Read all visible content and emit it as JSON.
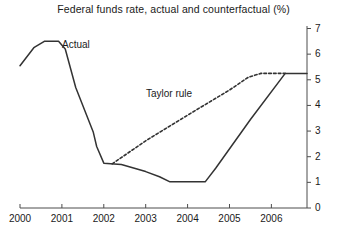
{
  "chart_data": {
    "type": "line",
    "title": "Federal funds rate, actual and counterfactual (%)",
    "xlabel": "",
    "ylabel": "",
    "ylim": [
      0,
      7
    ],
    "xlim": [
      2000,
      2006.85
    ],
    "grid": false,
    "yticks": [
      "0",
      "1",
      "2",
      "3",
      "4",
      "5",
      "6",
      "7"
    ],
    "ytick_values": [
      0,
      1,
      2,
      3,
      4,
      5,
      6,
      7
    ],
    "xticks": [
      "2000",
      "2001",
      "2002",
      "2003",
      "2004",
      "2005",
      "2006"
    ],
    "xtick_values": [
      2000,
      2001,
      2002,
      2003,
      2004,
      2005,
      2006
    ],
    "y_axis_position": "right",
    "legend": "inline-annotations",
    "annotations": [
      {
        "text": "Actual",
        "x": 2001.0,
        "y": 6.15
      },
      {
        "text": "Taylor rule",
        "x": 2003.05,
        "y": 4.45
      }
    ],
    "series": [
      {
        "name": "Actual",
        "style": "solid",
        "color": "#333333",
        "points": [
          [
            2000.0,
            5.55
          ],
          [
            2000.33,
            6.25
          ],
          [
            2000.58,
            6.5
          ],
          [
            2000.92,
            6.5
          ],
          [
            2001.08,
            6.2
          ],
          [
            2001.33,
            4.7
          ],
          [
            2001.75,
            2.95
          ],
          [
            2001.83,
            2.4
          ],
          [
            2002.0,
            1.75
          ],
          [
            2002.25,
            1.72
          ],
          [
            2002.42,
            1.7
          ],
          [
            2003.0,
            1.42
          ],
          [
            2003.33,
            1.22
          ],
          [
            2003.58,
            1.02
          ],
          [
            2004.42,
            1.02
          ],
          [
            2004.67,
            1.55
          ],
          [
            2005.5,
            3.45
          ],
          [
            2006.33,
            5.25
          ],
          [
            2006.85,
            5.25
          ]
        ]
      },
      {
        "name": "Taylor rule",
        "style": "dotted",
        "color": "#333333",
        "points": [
          [
            2002.2,
            1.72
          ],
          [
            2003.0,
            2.62
          ],
          [
            2004.0,
            3.62
          ],
          [
            2005.0,
            4.6
          ],
          [
            2005.45,
            5.1
          ],
          [
            2005.75,
            5.25
          ],
          [
            2006.33,
            5.25
          ]
        ]
      }
    ]
  }
}
